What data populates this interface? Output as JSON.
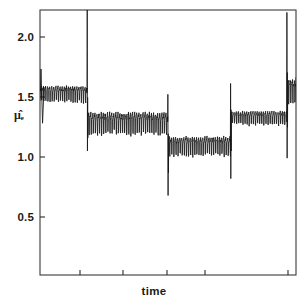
{
  "figure": {
    "kind": "line-plot",
    "background_color": "#ffffff",
    "ink_color": "#171717",
    "frame": {
      "left_px": 40,
      "right_px": 296,
      "top_px": 10,
      "bottom_px": 275,
      "border_color": "#3a3a3a"
    }
  },
  "axes": {
    "x": {
      "label": "time",
      "tick_labels": [],
      "tick_positions_px": [
        80,
        123,
        167,
        205,
        288
      ],
      "range": [
        0,
        1
      ],
      "grid": false
    },
    "y": {
      "label": "μ̂ₑ",
      "label_plain": "mu-hat-e",
      "tick_labels": [
        "2.0",
        "1.5",
        "1.0",
        "0.5"
      ],
      "tick_values": [
        2.0,
        1.5,
        1.0,
        0.5
      ],
      "tick_positions_px": [
        37,
        97,
        157,
        217
      ],
      "range": [
        0.12,
        2.32
      ],
      "grid": false
    }
  },
  "chart_data": {
    "type": "line",
    "title": "",
    "subtitle": "",
    "xlabel": "time",
    "ylabel": "μ̂ₑ",
    "xlim": [
      0,
      1
    ],
    "ylim": [
      0.12,
      2.32
    ],
    "grid": false,
    "legend": null,
    "series": [
      {
        "name": "mu-hat-e estimate",
        "color": "#171717",
        "segments": [
          {
            "index": 0,
            "x_start": 0.0,
            "x_end": 0.185,
            "plateau_value": 1.63,
            "noise_amplitude": 0.06,
            "entry_transient": {
              "peak": 1.83,
              "trough": 1.38
            }
          },
          {
            "index": 1,
            "x_start": 0.185,
            "x_end": 0.5,
            "plateau_value": 1.39,
            "noise_amplitude": 0.08,
            "entry_transient": {
              "peak": 2.32,
              "trough": 1.15
            }
          },
          {
            "index": 2,
            "x_start": 0.5,
            "x_end": 0.745,
            "plateau_value": 1.2,
            "noise_amplitude": 0.07,
            "entry_transient": {
              "peak": 1.62,
              "trough": 0.78
            }
          },
          {
            "index": 3,
            "x_start": 0.745,
            "x_end": 0.965,
            "plateau_value": 1.43,
            "noise_amplitude": 0.05,
            "entry_transient": {
              "peak": 1.71,
              "trough": 0.92
            }
          },
          {
            "index": 4,
            "x_start": 0.965,
            "x_end": 1.0,
            "plateau_value": 1.66,
            "noise_amplitude": 0.09,
            "entry_transient": {
              "peak": 2.3,
              "trough": 1.09
            }
          }
        ],
        "values": [
          1.63,
          1.39,
          1.2,
          1.43,
          1.66
        ]
      }
    ]
  }
}
